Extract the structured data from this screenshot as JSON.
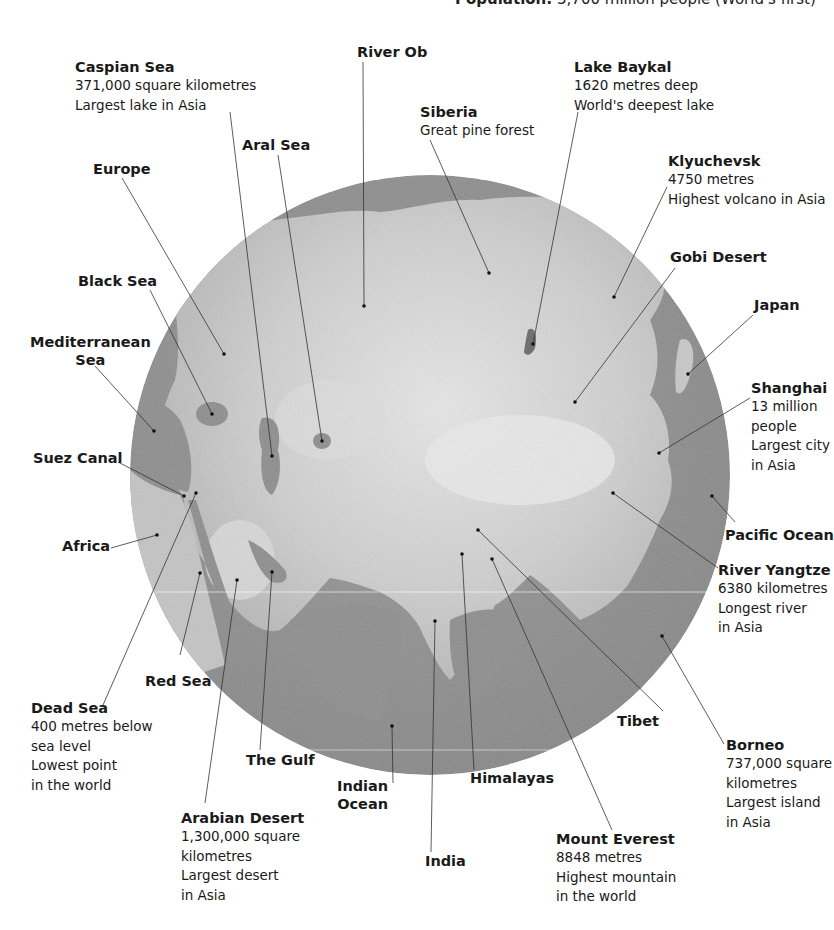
{
  "header": {
    "label": "Population:",
    "value": "3,700 million people (World's first)"
  },
  "globe": {
    "center": [
      430,
      475
    ],
    "radius": 300,
    "ocean_color": "#8c8c8c",
    "land_color": "#c9c9c9",
    "highland_color": "#e6e6e6",
    "seams_y": [
      592,
      750
    ]
  },
  "labels": [
    {
      "id": "caspian-sea",
      "title": "Caspian Sea",
      "lines": [
        "371,000 square kilometres",
        "Largest lake in Asia"
      ],
      "x": 75,
      "y": 58,
      "anchor": [
        230,
        112
      ],
      "dot": [
        272,
        456
      ]
    },
    {
      "id": "river-ob",
      "title": "River Ob",
      "lines": [],
      "x": 357,
      "y": 43,
      "anchor": [
        363,
        62
      ],
      "dot": [
        364,
        306
      ]
    },
    {
      "id": "lake-baykal",
      "title": "Lake Baykal",
      "lines": [
        "1620 metres deep",
        "World's deepest lake"
      ],
      "x": 574,
      "y": 58,
      "anchor": [
        578,
        112
      ],
      "dot": [
        533,
        344
      ]
    },
    {
      "id": "siberia",
      "title": "Siberia",
      "lines": [
        "Great pine forest"
      ],
      "x": 420,
      "y": 103,
      "anchor": [
        430,
        140
      ],
      "dot": [
        489,
        273
      ]
    },
    {
      "id": "aral-sea",
      "title": "Aral Sea",
      "lines": [],
      "x": 242,
      "y": 136,
      "anchor": [
        278,
        155
      ],
      "dot": [
        322,
        441
      ]
    },
    {
      "id": "europe",
      "title": "Europe",
      "lines": [],
      "x": 93,
      "y": 160,
      "anchor": [
        122,
        178
      ],
      "dot": [
        224,
        354
      ]
    },
    {
      "id": "klyuchevsk",
      "title": "Klyuchevsk",
      "lines": [
        "4750 metres",
        "Highest volcano in Asia"
      ],
      "x": 668,
      "y": 152,
      "anchor": [
        667,
        187
      ],
      "dot": [
        614,
        297
      ]
    },
    {
      "id": "gobi-desert",
      "title": "Gobi Desert",
      "lines": [],
      "x": 670,
      "y": 248,
      "anchor": [
        675,
        268
      ],
      "dot": [
        575,
        402
      ]
    },
    {
      "id": "black-sea",
      "title": "Black Sea",
      "lines": [],
      "x": 78,
      "y": 272,
      "anchor": [
        150,
        290
      ],
      "dot": [
        212,
        414
      ]
    },
    {
      "id": "japan",
      "title": "Japan",
      "lines": [],
      "x": 754,
      "y": 296,
      "anchor": [
        753,
        315
      ],
      "dot": [
        688,
        374
      ]
    },
    {
      "id": "mediterranean-sea",
      "title": "Mediterranean\nSea",
      "lines": [],
      "x": 30,
      "y": 333,
      "anchor": [
        95,
        366
      ],
      "dot": [
        154,
        431
      ],
      "center": true
    },
    {
      "id": "shanghai",
      "title": "Shanghai",
      "lines": [
        "13 million",
        "people",
        "Largest city",
        "in Asia"
      ],
      "x": 751,
      "y": 379,
      "anchor": [
        750,
        398
      ],
      "dot": [
        659,
        453
      ]
    },
    {
      "id": "suez-canal",
      "title": "Suez Canal",
      "lines": [],
      "x": 33,
      "y": 449,
      "anchor": [
        118,
        462
      ],
      "dot": [
        184,
        496
      ]
    },
    {
      "id": "pacific-ocean",
      "title": "Pacific Ocean",
      "lines": [],
      "x": 725,
      "y": 526,
      "anchor": [
        735,
        522
      ],
      "dot": [
        712,
        496
      ]
    },
    {
      "id": "africa",
      "title": "Africa",
      "lines": [],
      "x": 62,
      "y": 537,
      "anchor": [
        111,
        548
      ],
      "dot": [
        157,
        535
      ]
    },
    {
      "id": "river-yangtze",
      "title": "River Yangtze",
      "lines": [
        "6380 kilometres",
        "Longest river",
        "in Asia"
      ],
      "x": 718,
      "y": 561,
      "anchor": [
        718,
        568
      ],
      "dot": [
        613,
        493
      ]
    },
    {
      "id": "red-sea",
      "title": "Red Sea",
      "lines": [],
      "x": 145,
      "y": 672,
      "anchor": [
        180,
        655
      ],
      "dot": [
        200,
        573
      ]
    },
    {
      "id": "dead-sea",
      "title": "Dead Sea",
      "lines": [
        "400 metres below",
        "sea level",
        "Lowest point",
        "in the world"
      ],
      "x": 31,
      "y": 699,
      "anchor": [
        103,
        705
      ],
      "dot": [
        196,
        493
      ]
    },
    {
      "id": "tibet",
      "title": "Tibet",
      "lines": [],
      "x": 617,
      "y": 712,
      "anchor": [
        663,
        711
      ],
      "dot": [
        478,
        530
      ]
    },
    {
      "id": "borneo",
      "title": "Borneo",
      "lines": [
        "737,000 square",
        "kilometres",
        "Largest island",
        "in Asia"
      ],
      "x": 726,
      "y": 736,
      "anchor": [
        724,
        744
      ],
      "dot": [
        662,
        636
      ]
    },
    {
      "id": "the-gulf",
      "title": "The Gulf",
      "lines": [],
      "x": 246,
      "y": 751,
      "anchor": [
        260,
        750
      ],
      "dot": [
        272,
        572
      ]
    },
    {
      "id": "indian-ocean",
      "title": "Indian\nOcean",
      "lines": [],
      "x": 337,
      "y": 777,
      "anchor": [
        393,
        783
      ],
      "dot": [
        392,
        726
      ],
      "center": true
    },
    {
      "id": "himalayas",
      "title": "Himalayas",
      "lines": [],
      "x": 470,
      "y": 769,
      "anchor": [
        474,
        770
      ],
      "dot": [
        462,
        554
      ]
    },
    {
      "id": "arabian-desert",
      "title": "Arabian Desert",
      "lines": [
        "1,300,000 square",
        "kilometres",
        "Largest desert",
        "in Asia"
      ],
      "x": 181,
      "y": 809,
      "anchor": [
        205,
        803
      ],
      "dot": [
        237,
        580
      ]
    },
    {
      "id": "india",
      "title": "India",
      "lines": [],
      "x": 425,
      "y": 852,
      "anchor": [
        431,
        852
      ],
      "dot": [
        435,
        621
      ]
    },
    {
      "id": "mount-everest",
      "title": "Mount Everest",
      "lines": [
        "8848 metres",
        "Highest mountain",
        "in the world"
      ],
      "x": 556,
      "y": 830,
      "anchor": [
        612,
        830
      ],
      "dot": [
        492,
        559
      ]
    }
  ]
}
